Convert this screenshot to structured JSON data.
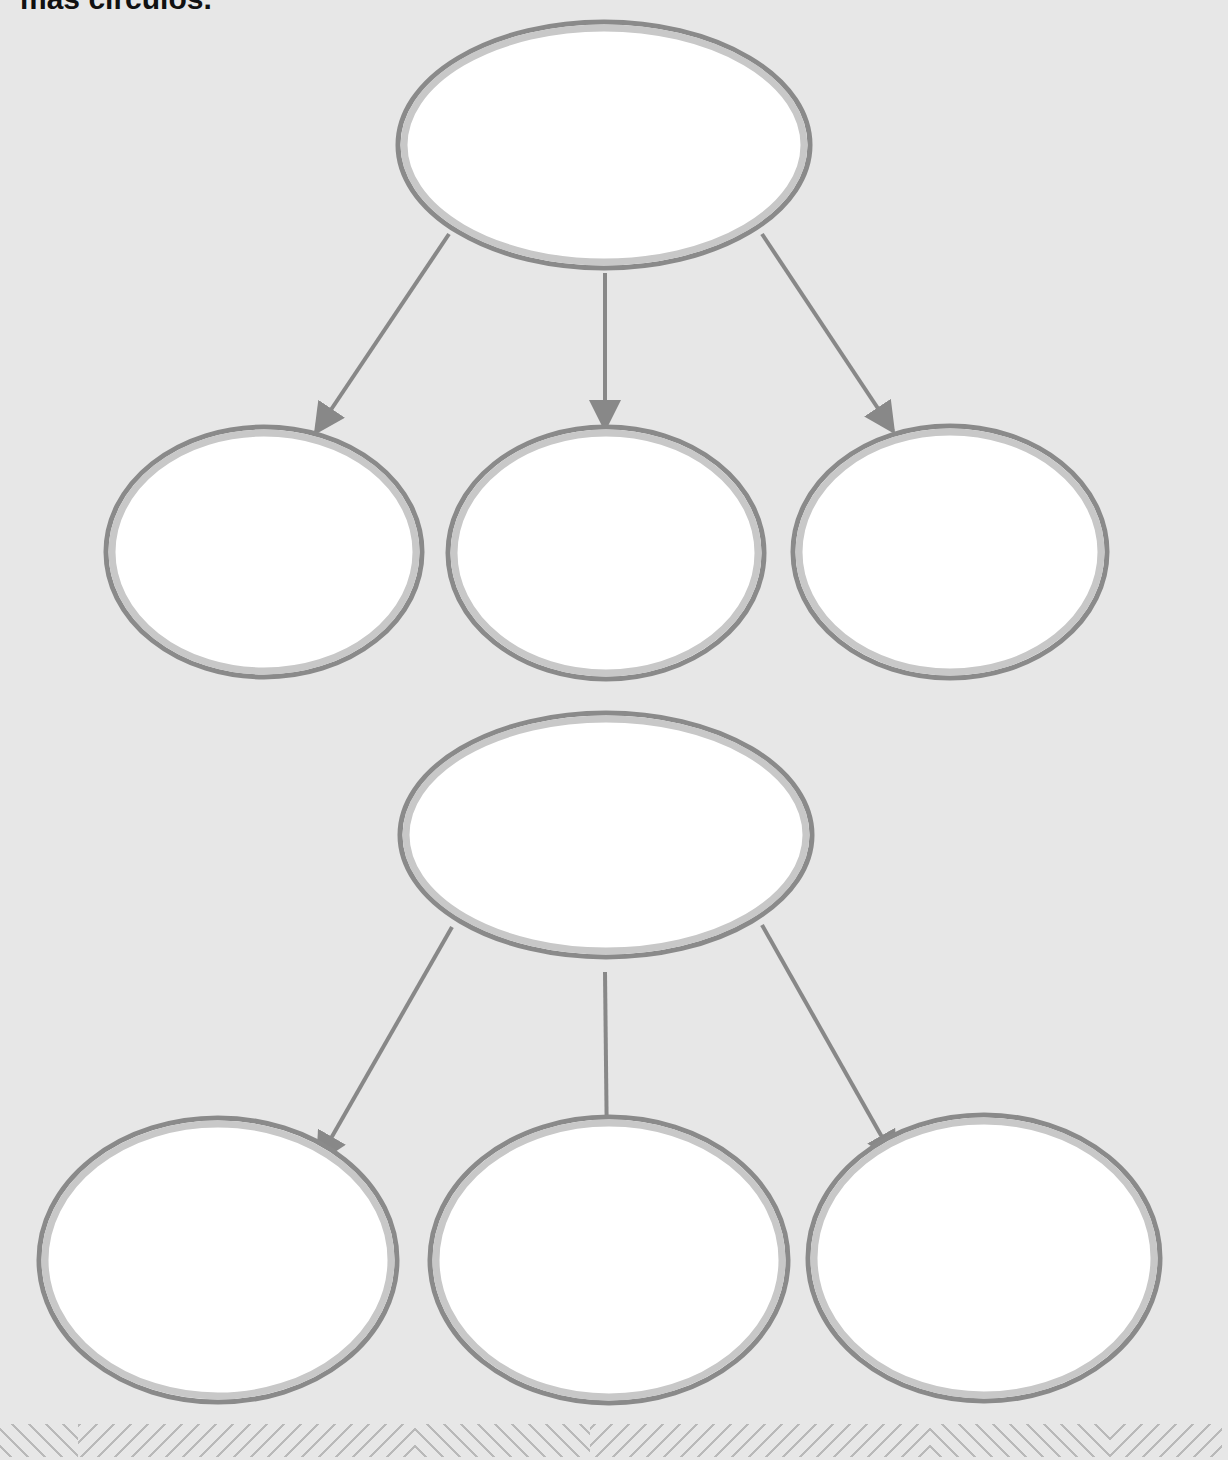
{
  "header": {
    "text": "más círculos."
  },
  "diagram": {
    "type": "hierarchy-graphic-organizer",
    "colors": {
      "background": "#e7e7e7",
      "node_fill": "#ffffff",
      "node_outer_stroke": "#8a8a8a",
      "node_inner_band": "#c8c8c8",
      "arrow": "#888888",
      "hatch": "#b9b9b9"
    },
    "groups": [
      {
        "parent": {
          "label": "",
          "cx": 604,
          "cy": 145,
          "rx": 206,
          "ry": 123
        },
        "children": [
          {
            "label": "",
            "cx": 264,
            "cy": 552,
            "rx": 158,
            "ry": 125
          },
          {
            "label": "",
            "cx": 606,
            "cy": 553,
            "rx": 158,
            "ry": 126
          },
          {
            "label": "",
            "cx": 950,
            "cy": 552,
            "rx": 157,
            "ry": 126
          }
        ],
        "arrows": [
          {
            "x1": 449,
            "y1": 234,
            "x2": 316,
            "y2": 432
          },
          {
            "x1": 605,
            "y1": 273,
            "x2": 605,
            "y2": 428
          },
          {
            "x1": 762,
            "y1": 234,
            "x2": 893,
            "y2": 431
          }
        ]
      },
      {
        "parent": {
          "label": "",
          "cx": 606,
          "cy": 835,
          "rx": 206,
          "ry": 122
        },
        "children": [
          {
            "label": "",
            "cx": 218,
            "cy": 1260,
            "rx": 179,
            "ry": 142
          },
          {
            "label": "",
            "cx": 609,
            "cy": 1260,
            "rx": 179,
            "ry": 143
          },
          {
            "label": "",
            "cx": 984,
            "cy": 1258,
            "rx": 176,
            "ry": 143
          }
        ],
        "arrows": [
          {
            "x1": 452,
            "y1": 927,
            "x2": 318,
            "y2": 1161
          },
          {
            "x1": 605,
            "y1": 972,
            "x2": 607,
            "y2": 1155
          },
          {
            "x1": 762,
            "y1": 925,
            "x2": 895,
            "y2": 1160
          }
        ]
      }
    ]
  },
  "footer_band": {
    "segments": [
      {
        "dir": "back",
        "x": 0,
        "w": 78
      },
      {
        "dir": "fwd",
        "x": 78,
        "w": 337
      },
      {
        "dir": "back",
        "x": 415,
        "w": 175
      },
      {
        "dir": "fwd",
        "x": 590,
        "w": 340
      },
      {
        "dir": "back",
        "x": 930,
        "w": 180
      },
      {
        "dir": "fwd",
        "x": 1110,
        "w": 112
      }
    ]
  }
}
